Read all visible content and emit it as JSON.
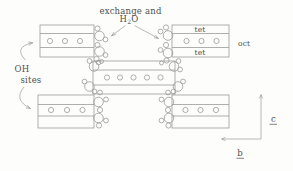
{
  "figure": {
    "colors": {
      "background": "#fdfdfc",
      "line": "#9b9b9b",
      "text": "#4f4f4f"
    },
    "labels": {
      "exchange_line1": "exchange and",
      "h2o_h": "H",
      "h2o_sub": "2",
      "h2o_o": "O",
      "oh_line1": "OH",
      "oh_line2": "sites",
      "tet_top": "tet",
      "tet_bottom": "tet",
      "oct": "oct",
      "axis_c": "c",
      "axis_b": "b"
    },
    "blocks": [
      {
        "name": "top-left-block",
        "x": 40,
        "y": 25,
        "w": 54,
        "h": 32,
        "dividers_y": [
          33.5,
          47.5
        ],
        "cation_y": 41,
        "cation_r": 2.6,
        "cation_xs": [
          50,
          65,
          80
        ]
      },
      {
        "name": "top-right-block",
        "x": 172,
        "y": 25,
        "w": 57,
        "h": 32,
        "dividers_y": [
          33.5,
          47.5
        ],
        "cation_y": 41,
        "cation_r": 2.6,
        "cation_xs": [
          186.5,
          201.5,
          216.5
        ]
      },
      {
        "name": "middle-block",
        "x": 93,
        "y": 61,
        "w": 82,
        "h": 33,
        "dividers_y": [
          70,
          85
        ],
        "cation_y": 77.5,
        "cation_r": 2.6,
        "cation_xs": [
          107,
          120,
          133.5,
          147,
          160.5
        ]
      },
      {
        "name": "bottom-left-block",
        "x": 38,
        "y": 95,
        "w": 56,
        "h": 33,
        "dividers_y": [
          104.5,
          116
        ],
        "cation_y": 110,
        "cation_r": 2.6,
        "cation_xs": [
          51,
          67,
          82.5
        ]
      },
      {
        "name": "bottom-right-block",
        "x": 172,
        "y": 95,
        "w": 57,
        "h": 33,
        "dividers_y": [
          104.5,
          116
        ],
        "cation_y": 110,
        "cation_r": 2.6,
        "cation_xs": [
          185.5,
          200.5,
          216
        ]
      }
    ],
    "site_circles": [
      [
        97.5,
        28.5,
        2.6
      ],
      [
        99.5,
        36,
        4.8
      ],
      [
        105.5,
        39.5,
        2.4
      ],
      [
        97.5,
        45,
        2.6
      ],
      [
        99.5,
        51.5,
        4.8
      ],
      [
        105.5,
        55,
        2.4
      ],
      [
        96.5,
        59,
        2.6
      ],
      [
        101.5,
        61.5,
        2
      ],
      [
        94,
        66.5,
        4.8
      ],
      [
        89.5,
        61,
        2.4
      ],
      [
        98.5,
        62.5,
        2.4
      ],
      [
        89.5,
        86.5,
        4.8
      ],
      [
        84.5,
        81.5,
        2.4
      ],
      [
        94.5,
        91.5,
        2.4
      ],
      [
        100,
        92.5,
        2.4
      ],
      [
        98.5,
        102,
        4.8
      ],
      [
        106,
        99.5,
        2.4
      ],
      [
        100,
        110,
        2.6
      ],
      [
        98.5,
        118,
        4.8
      ],
      [
        106,
        120.5,
        2.4
      ],
      [
        99,
        125.5,
        2.6
      ],
      [
        166,
        27.5,
        2.6
      ],
      [
        168,
        35.5,
        4.8
      ],
      [
        160.5,
        31.5,
        2.4
      ],
      [
        166,
        45,
        2.6
      ],
      [
        168,
        53,
        4.8
      ],
      [
        160.5,
        50,
        2.4
      ],
      [
        166.5,
        60.5,
        2.6
      ],
      [
        161.5,
        63,
        2
      ],
      [
        174,
        66.5,
        4.8
      ],
      [
        178.5,
        61,
        2.4
      ],
      [
        180,
        69.5,
        2.4
      ],
      [
        178,
        86.5,
        4.8
      ],
      [
        183,
        81.5,
        2.4
      ],
      [
        173.5,
        91.5,
        2.4
      ],
      [
        168,
        92.5,
        2.4
      ],
      [
        169,
        102,
        4.8
      ],
      [
        161.5,
        99.5,
        2.4
      ],
      [
        168,
        110,
        2.6
      ],
      [
        169,
        118,
        4.8
      ],
      [
        161.5,
        120.5,
        2.4
      ],
      [
        168.5,
        125.5,
        2.6
      ]
    ],
    "arrow_paths": [
      "M125.5,25.5 L111.5,35.8 M115.8,34.5 L111.5,35.8 L114,32.1",
      "M134.5,25.5 L158.5,38.5 M155.5,35.1 L158.5,38.5 L154.1,37.8",
      "M25.5,60 Q13,47.5 32.5,42.6 M28.2,42 L33,42.8 L28.9,45.1",
      "M24,87 Q13,100 30.5,108.5 M27.4,105.3 L30.5,108.5 L26,108",
      "M261,139 L261,95 M259.4,98.4 L261,94.5 L262.6,98.4",
      "M261,139 L222,139 M225.4,137.4 L221.5,139 L225.4,140.6"
    ]
  }
}
